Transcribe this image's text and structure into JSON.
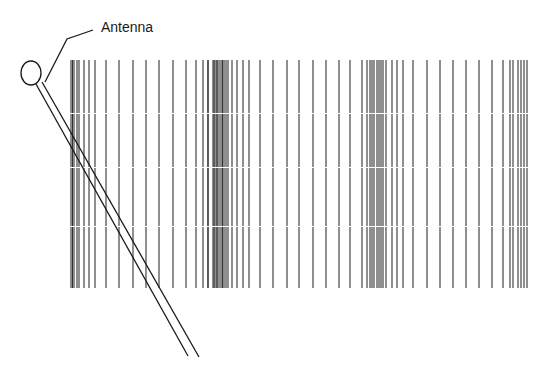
{
  "diagram": {
    "label": "Antenna",
    "label_pos": {
      "x": 101,
      "y": 20
    },
    "colors": {
      "stroke": "#1a1a1a",
      "grating": "#333333",
      "background": "#ffffff"
    },
    "antenna": {
      "head": {
        "cx": 31,
        "cy": 73,
        "rx": 10,
        "ry": 12
      },
      "rod": [
        {
          "x1": 36,
          "y1": 84,
          "x2": 188,
          "y2": 356
        },
        {
          "x1": 42,
          "y1": 82,
          "x2": 199,
          "y2": 357
        }
      ],
      "leader": [
        [
          93,
          30
        ],
        [
          67,
          39
        ],
        [
          45,
          82
        ]
      ]
    },
    "grating": {
      "y_top": 60,
      "y_bottom": 288,
      "segment_breaks": [
        113,
        167,
        226
      ],
      "line_x": [
        71,
        72.5,
        74,
        77,
        79,
        84,
        89,
        95,
        106,
        119,
        133,
        146,
        159,
        173,
        186,
        196,
        203,
        208,
        214,
        217,
        208,
        213,
        215,
        217,
        219,
        221,
        222.5,
        224,
        226,
        228,
        232,
        237,
        243,
        249,
        260,
        273,
        287,
        299,
        313,
        326,
        339,
        350,
        362,
        367,
        370,
        372,
        374,
        377,
        379,
        381,
        383,
        386,
        392,
        397,
        403,
        413,
        427,
        440,
        453,
        466,
        479,
        492,
        503,
        510,
        513,
        518,
        521,
        524,
        527
      ]
    }
  }
}
